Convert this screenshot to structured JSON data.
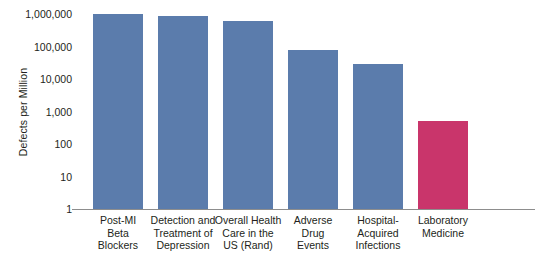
{
  "chart_data": {
    "type": "bar",
    "title": "",
    "xlabel": "",
    "ylabel": "Defects per Million",
    "yscale": "log",
    "ylim": [
      1,
      1000000
    ],
    "ytick_labels": [
      "1,000,000",
      "100,000",
      "10,000",
      "1,000",
      "100",
      "10",
      "1"
    ],
    "ytick_values": [
      1000000,
      100000,
      10000,
      1000,
      100,
      10,
      1
    ],
    "grid": false,
    "legend": null,
    "categories": [
      "Post-MI\nBeta\nBlockers",
      "Detection and\nTreatment of\nDepression",
      "Overall Health\nCare in the\nUS (Rand)",
      "Adverse\nDrug\nEvents",
      "Hospital-\nAcquired\nInfections",
      "Laboratory\nMedicine"
    ],
    "values": [
      1000000,
      850000,
      600000,
      80000,
      30000,
      500
    ],
    "colors": [
      "#5b7cac",
      "#5b7cac",
      "#5b7cac",
      "#5b7cac",
      "#5b7cac",
      "#c9356b"
    ],
    "series": [
      {
        "name": "Defects per Million",
        "values": [
          1000000,
          850000,
          600000,
          80000,
          30000,
          500
        ]
      }
    ]
  },
  "style": {
    "bar_blue": "#5b7cac",
    "bar_red": "#c9356b",
    "axis_color": "#8d8d8d",
    "text_color": "#231f20",
    "background": "#ffffff"
  }
}
